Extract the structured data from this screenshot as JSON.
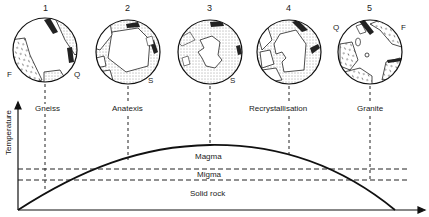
{
  "figure": {
    "y_axis_label": "Temperature",
    "stages": [
      {
        "number": "1",
        "label": "Gneiss",
        "side_labels": [
          "F",
          "Q"
        ]
      },
      {
        "number": "2",
        "label": "Anatexis",
        "side_labels": [
          "S"
        ]
      },
      {
        "number": "3",
        "label": "",
        "side_labels": [
          "S"
        ]
      },
      {
        "number": "4",
        "label": "Recrystallisation",
        "side_labels": []
      },
      {
        "number": "5",
        "label": "Granite",
        "side_labels": [
          "Q",
          "F"
        ]
      }
    ],
    "zones": {
      "magma": "Magma",
      "migma": "Migma",
      "solid_rock": "Solid rock"
    }
  }
}
